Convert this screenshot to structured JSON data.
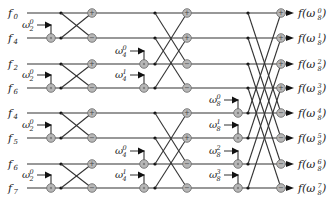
{
  "colors": {
    "wire": "#333333",
    "node_fill": "#b7b7b7",
    "node_stroke": "#666666",
    "background": "#ffffff"
  },
  "inputs": [
    {
      "label": "f",
      "sub": "0"
    },
    {
      "label": "f",
      "sub": "4"
    },
    {
      "label": "f",
      "sub": "2"
    },
    {
      "label": "f",
      "sub": "6"
    },
    {
      "label": "f",
      "sub": "4"
    },
    {
      "label": "f",
      "sub": "5"
    },
    {
      "label": "f",
      "sub": "6"
    },
    {
      "label": "f",
      "sub": "7"
    }
  ],
  "outputs": [
    {
      "text": "f(ω",
      "base": "8",
      "exp": "0",
      "close": ")"
    },
    {
      "text": "f(ω",
      "base": "8",
      "exp": "1",
      "close": ")"
    },
    {
      "text": "f(ω",
      "base": "8",
      "exp": "2",
      "close": ")"
    },
    {
      "text": "f(ω",
      "base": "8",
      "exp": "3",
      "close": ")"
    },
    {
      "text": "f(ω",
      "base": "8",
      "exp": "4",
      "close": ")"
    },
    {
      "text": "f(ω",
      "base": "8",
      "exp": "5",
      "close": ")"
    },
    {
      "text": "f(ω",
      "base": "8",
      "exp": "6",
      "close": ")"
    },
    {
      "text": "f(ω",
      "base": "8",
      "exp": "7",
      "close": ")"
    }
  ],
  "stages": [
    {
      "name": "stage-1",
      "twiddles": [
        {
          "symbol": "ω",
          "sub": "2",
          "sup": "0",
          "row": 1
        },
        {
          "symbol": "ω",
          "sub": "2",
          "sup": "0",
          "row": 3
        },
        {
          "symbol": "ω",
          "sub": "2",
          "sup": "0",
          "row": 5
        },
        {
          "symbol": "ω",
          "sub": "2",
          "sup": "0",
          "row": 7
        }
      ],
      "butterflies": [
        [
          0,
          1
        ],
        [
          2,
          3
        ],
        [
          4,
          5
        ],
        [
          6,
          7
        ]
      ]
    },
    {
      "name": "stage-2",
      "twiddles": [
        {
          "symbol": "ω",
          "sub": "4",
          "sup": "0",
          "row": 2
        },
        {
          "symbol": "ω",
          "sub": "4",
          "sup": "1",
          "row": 3
        },
        {
          "symbol": "ω",
          "sub": "4",
          "sup": "0",
          "row": 6
        },
        {
          "symbol": "ω",
          "sub": "4",
          "sup": "1",
          "row": 7
        }
      ],
      "butterflies": [
        [
          0,
          2
        ],
        [
          1,
          3
        ],
        [
          4,
          6
        ],
        [
          5,
          7
        ]
      ]
    },
    {
      "name": "stage-3",
      "twiddles": [
        {
          "symbol": "ω",
          "sub": "8",
          "sup": "0",
          "row": 4
        },
        {
          "symbol": "ω",
          "sub": "8",
          "sup": "1",
          "row": 5
        },
        {
          "symbol": "ω",
          "sub": "8",
          "sup": "2",
          "row": 6
        },
        {
          "symbol": "ω",
          "sub": "8",
          "sup": "3",
          "row": 7
        }
      ],
      "butterflies": [
        [
          0,
          4
        ],
        [
          1,
          5
        ],
        [
          2,
          6
        ],
        [
          3,
          7
        ]
      ]
    }
  ],
  "node_symbols": {
    "plus": "+",
    "minus": "−"
  }
}
